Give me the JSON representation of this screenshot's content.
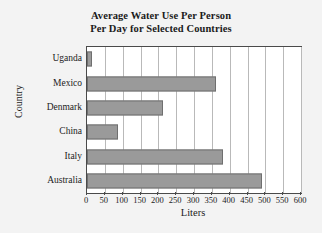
{
  "chart_data": {
    "type": "bar",
    "orientation": "horizontal",
    "title": "Average Water Use Per Person Per Day for Selected Countries",
    "title_lines": [
      "Average Water Use Per Person",
      "Per Day for Selected Countries"
    ],
    "xlabel": "Liters",
    "ylabel": "Country",
    "categories": [
      "Uganda",
      "Mexico",
      "Denmark",
      "China",
      "Italy",
      "Australia"
    ],
    "values": [
      15,
      361,
      213,
      87,
      381,
      490
    ],
    "xlim": [
      0,
      600
    ],
    "xticks": [
      0,
      50,
      100,
      150,
      200,
      250,
      300,
      350,
      400,
      450,
      500,
      550,
      600
    ],
    "xtick_labels": [
      "0",
      "50",
      "100",
      "150",
      "200",
      "250",
      "300",
      "350",
      "400",
      "450",
      "500",
      "550",
      "600"
    ],
    "grid": "vertical",
    "legend": "none",
    "bar_color": "#9a9a9a",
    "bar_edge_color": "#6f6f6f",
    "plot_background": "#ffffff",
    "figure_background": "#f3f3f3",
    "axis_color": "#4a4a4a",
    "gridline_color": "#b9b9b9",
    "text_color": "#1b1b1b"
  }
}
